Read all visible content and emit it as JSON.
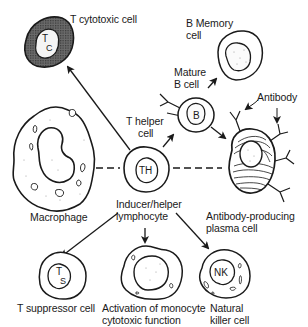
{
  "diagram": {
    "type": "immune-cell-differentiation",
    "center_cell": {
      "inner_label": "TH",
      "name_line1": "T helper",
      "name_line2": "cell",
      "role_line1": "Inducer/helper",
      "role_line2": "lymphocyte"
    },
    "cells": [
      {
        "id": "t-cytotoxic",
        "inner_main": "T",
        "inner_sub": "C",
        "label": "T  cytotoxic cell"
      },
      {
        "id": "b-memory",
        "label_line1": "B Memory",
        "label_line2": "cell"
      },
      {
        "id": "mature-b",
        "inner_label": "B",
        "label_line1": "Mature",
        "label_line2": "B cell"
      },
      {
        "id": "plasma",
        "label_line1": "Antibody-producing",
        "label_line2": "plasma cell",
        "annotation": "Antibody"
      },
      {
        "id": "macrophage",
        "label": "Macrophage"
      },
      {
        "id": "t-suppressor",
        "inner_main": "T",
        "inner_sub": "S",
        "label": "T  suppressor cell"
      },
      {
        "id": "monocyte",
        "label_line1": "Activation of monocyte",
        "label_line2": "cytotoxic function"
      },
      {
        "id": "nk",
        "inner_label": "NK",
        "label_line1": "Natural",
        "label_line2": "killer cell"
      }
    ],
    "connections": [
      {
        "from": "TH",
        "to": "T cytotoxic cell",
        "style": "arrow"
      },
      {
        "from": "TH",
        "to": "Mature B cell",
        "style": "arrow"
      },
      {
        "from": "Mature B cell",
        "to": "B Memory cell",
        "style": "arrow"
      },
      {
        "from": "Mature B cell",
        "to": "Antibody-producing plasma cell",
        "style": "arrow"
      },
      {
        "from": "Macrophage",
        "to": "TH",
        "style": "dashed"
      },
      {
        "from": "TH",
        "to": "Antibody-producing plasma cell",
        "style": "dashed"
      },
      {
        "from": "TH",
        "to": "T suppressor cell",
        "style": "arrow"
      },
      {
        "from": "TH",
        "to": "Activation of monocyte cytotoxic function",
        "style": "arrow"
      },
      {
        "from": "TH",
        "to": "Natural killer cell",
        "style": "arrow"
      }
    ],
    "colors": {
      "ink": "#1a1a1a",
      "background": "#ffffff",
      "shading": "#555555"
    }
  }
}
